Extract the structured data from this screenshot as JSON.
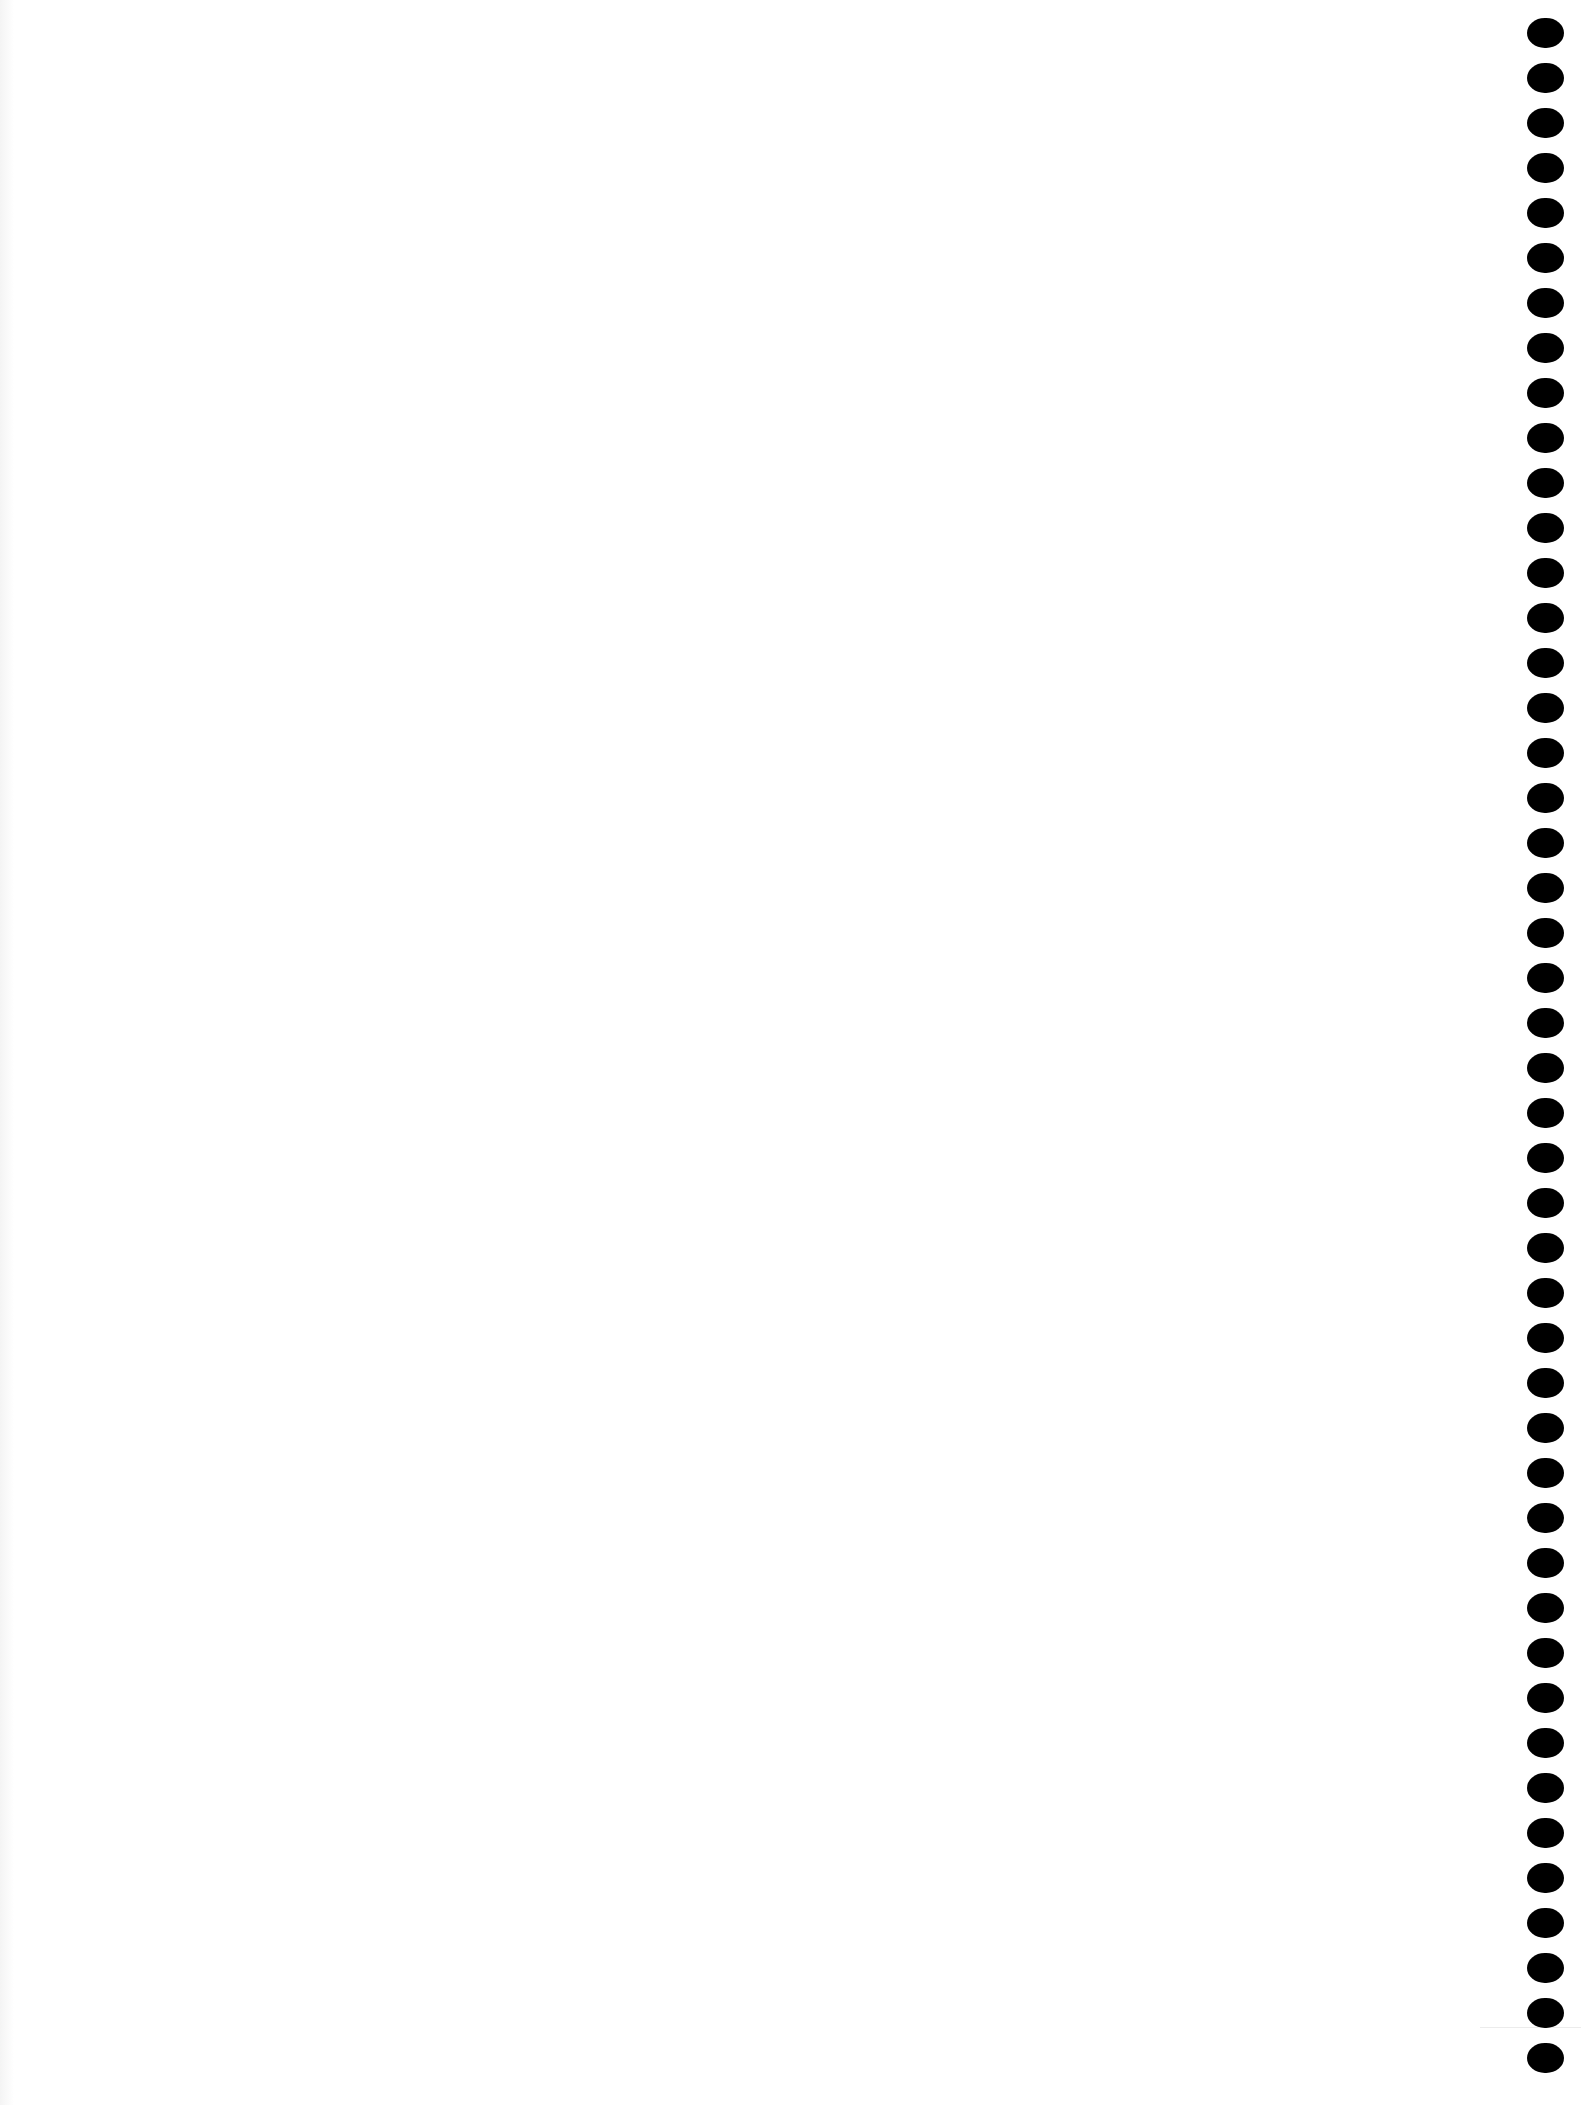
{
  "document": {
    "type": "blank-page",
    "background_color": "#ffffff",
    "binding": {
      "side": "right",
      "hole_count": 46,
      "hole_color": "#000000",
      "first_hole_top": 18,
      "hole_spacing": 45
    }
  }
}
